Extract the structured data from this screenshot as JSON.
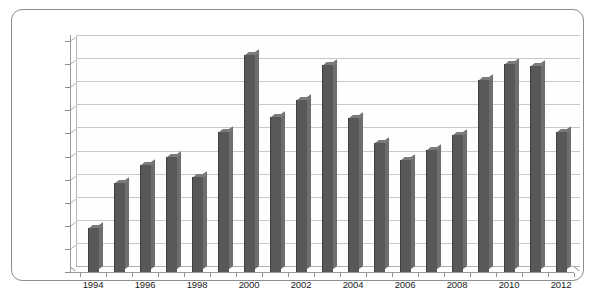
{
  "chart_data": {
    "type": "bar",
    "title": "",
    "subtitle": "",
    "xlabel": "",
    "ylabel": "",
    "categories": [
      "1994",
      "1995",
      "1996",
      "1997",
      "1998",
      "1999",
      "2000",
      "2001",
      "2002",
      "2003",
      "2004",
      "2005",
      "2006",
      "2007",
      "2008",
      "2009",
      "2010",
      "2011",
      "2012"
    ],
    "values": [
      95,
      193,
      231,
      248,
      205,
      303,
      470,
      335,
      372,
      448,
      333,
      280,
      243,
      265,
      297,
      415,
      450,
      445,
      302
    ],
    "visible_tick_labels": [
      "1994",
      "1996",
      "1998",
      "2000",
      "2002",
      "2004",
      "2006",
      "2008",
      "2010",
      "2012"
    ],
    "y_ticks": [
      0,
      50,
      100,
      150,
      200,
      250,
      300,
      350,
      400,
      450,
      500
    ],
    "ylim": [
      0,
      500
    ],
    "grid": true,
    "legend": false,
    "bar_color": "#585858",
    "gridline_color": "#c8c8c8",
    "axis_color": "#8d8d8d",
    "frame_color": "#8e8e8e",
    "background": "#ffffff"
  }
}
